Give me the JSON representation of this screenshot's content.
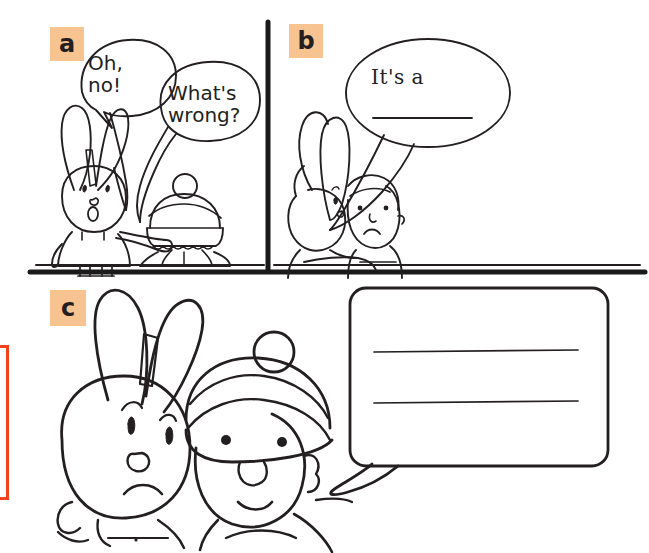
{
  "page": {
    "background_color": "#ffffff",
    "width": 649,
    "height": 553
  },
  "colors": {
    "ink": "#231f20",
    "panel_label_bg": "#F7C491",
    "marker_red": "#F4421E",
    "paper": "#ffffff"
  },
  "panels": [
    {
      "id": "a",
      "label": "a",
      "characters": [
        "rabbit-pointing",
        "child-bobble-hat-back-view"
      ],
      "bubbles": [
        {
          "id": "oh-no",
          "text": "Oh,\nno!",
          "speaker": "rabbit",
          "blank_lines": 0
        },
        {
          "id": "whats-wrong",
          "text": "What's\nwrong?",
          "speaker": "child",
          "blank_lines": 0
        }
      ]
    },
    {
      "id": "b",
      "label": "b",
      "characters": [
        "rabbit-hugging",
        "child-sad"
      ],
      "bubbles": [
        {
          "id": "its-a",
          "text": "It's a",
          "speaker": "child",
          "blank_lines": 1
        }
      ]
    },
    {
      "id": "c",
      "label": "c",
      "characters": [
        "rabbit-sad-closeup",
        "child-smiling-closeup"
      ],
      "bubbles": [
        {
          "id": "blank-answer",
          "text": "",
          "speaker": "child",
          "blank_lines": 2
        }
      ]
    }
  ],
  "bubble_text": {
    "oh_no": "Oh,\nno!",
    "whats_wrong": "What's\nwrong?",
    "its_a": "It's a"
  },
  "dividers": {
    "vertical_x": 268,
    "horizontal_y": 272
  }
}
